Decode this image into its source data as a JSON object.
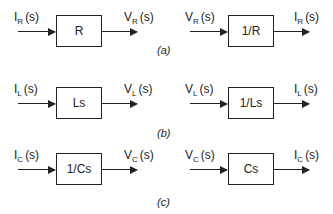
{
  "diagram": {
    "type": "block-diagram",
    "rows": [
      {
        "caption": "(a)",
        "left": {
          "input": {
            "base": "I",
            "sub": "R",
            "arg": "(s)"
          },
          "block": "R",
          "output": {
            "base": "V",
            "sub": "R",
            "arg": "(s)"
          }
        },
        "right": {
          "input": {
            "base": "V",
            "sub": "R",
            "arg": "(s)"
          },
          "block": "1/R",
          "output": {
            "base": "I",
            "sub": "R",
            "arg": "(s)"
          }
        }
      },
      {
        "caption": "(b)",
        "left": {
          "input": {
            "base": "I",
            "sub": "L",
            "arg": "(s)"
          },
          "block": "Ls",
          "output": {
            "base": "V",
            "sub": "L",
            "arg": "(s)"
          }
        },
        "right": {
          "input": {
            "base": "V",
            "sub": "L",
            "arg": "(s)"
          },
          "block": "1/Ls",
          "output": {
            "base": "I",
            "sub": "L",
            "arg": "(s)"
          }
        }
      },
      {
        "caption": "(c)",
        "left": {
          "input": {
            "base": "I",
            "sub": "C",
            "arg": "(s)"
          },
          "block": "1/Cs",
          "output": {
            "base": "V",
            "sub": "C",
            "arg": "(s)"
          }
        },
        "right": {
          "input": {
            "base": "V",
            "sub": "C",
            "arg": "(s)"
          },
          "block": "Cs",
          "output": {
            "base": "I",
            "sub": "C",
            "arg": "(s)"
          }
        }
      }
    ]
  }
}
